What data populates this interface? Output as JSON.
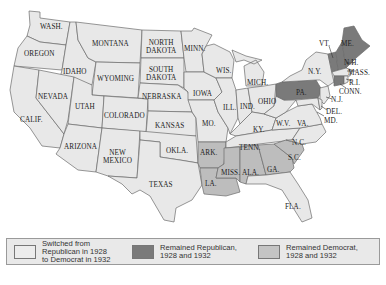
{
  "map": {
    "title": "",
    "colors": {
      "switched": "#e8e8e8",
      "remained_republican": "#7a7a7a",
      "remained_democrat": "#bdbdbd",
      "border": "#6b6b6b"
    },
    "state_labels": {
      "wash": "WASH.",
      "oregon": "OREGON",
      "calif": "CALIF.",
      "idaho": "IDAHO",
      "nevada": "NEVADA",
      "montana": "MONTANA",
      "wyoming": "WYOMING",
      "utah": "UTAH",
      "arizona": "ARIZONA",
      "colorado": "COLORADO",
      "new_mexico_1": "NEW",
      "new_mexico_2": "MEXICO",
      "north_dakota_1": "NORTH",
      "north_dakota_2": "DAKOTA",
      "south_dakota_1": "SOUTH",
      "south_dakota_2": "DAKOTA",
      "nebraska": "NEBRASKA",
      "kansas": "KANSAS",
      "okla": "OKLA.",
      "texas": "TEXAS",
      "minn": "MINN.",
      "iowa": "IOWA",
      "mo": "MO.",
      "ark": "ARK.",
      "la": "LA.",
      "wis": "WIS.",
      "ill": "ILL.",
      "mich": "MICH.",
      "ind": "IND.",
      "ohio": "OHIO",
      "ky": "KY.",
      "tenn": "TENN.",
      "miss": "MISS.",
      "ala": "ALA.",
      "ga": "GA.",
      "fla": "FLA.",
      "sc": "S.C.",
      "nc": "N.C.",
      "va": "VA.",
      "wv": "W.V.",
      "pa": "PA.",
      "ny": "N.Y.",
      "vt": "VT.",
      "me": "ME.",
      "nh": "N.H.",
      "mass": "MASS.",
      "ri": "R.I.",
      "conn": "CONN.",
      "nj": "N.J.",
      "del": "DEL.",
      "md": "MD."
    }
  },
  "legend": {
    "items": [
      {
        "label_1": "Switched from",
        "label_2": "Republican in 1928",
        "label_3": "to Democrat in 1932",
        "color": "#e8e8e8"
      },
      {
        "label_1": "Remained Republican,",
        "label_2": "1928 and 1932",
        "color": "#7a7a7a"
      },
      {
        "label_1": "Remained Democrat,",
        "label_2": "1928 and 1932",
        "color": "#bdbdbd"
      }
    ]
  }
}
